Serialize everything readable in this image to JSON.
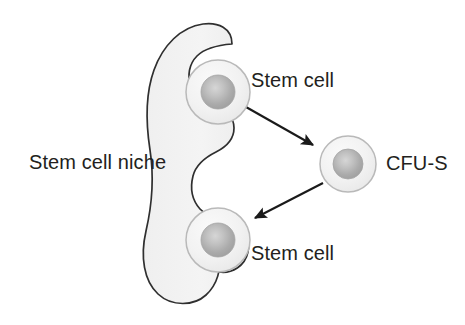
{
  "diagram": {
    "background_color": "#ffffff",
    "text_color": "#231f20",
    "labels": {
      "niche": "Stem cell niche",
      "stem_cell_top": "Stem cell",
      "stem_cell_bottom": "Stem cell",
      "cfu_s": "CFU-S"
    },
    "shapes": {
      "niche": {
        "name": "stem-cell-niche-body",
        "fill": "#f1f1f1",
        "stroke": "#2f2f2f",
        "stroke_width": 1.6
      },
      "cells": [
        {
          "name": "stem-cell-top",
          "cx": 218,
          "cy": 92,
          "r_outer": 32,
          "r_nucleus": 17,
          "outer_fill": "#f3f3f3",
          "outer_stroke": "#b9b9b9",
          "nucleus_fill": "#b0b0b0"
        },
        {
          "name": "cfu-s-cell",
          "cx": 348,
          "cy": 164,
          "r_outer": 28,
          "r_nucleus": 15,
          "outer_fill": "#f3f3f3",
          "outer_stroke": "#b9b9b9",
          "nucleus_fill": "#b0b0b0"
        },
        {
          "name": "stem-cell-bottom",
          "cx": 218,
          "cy": 240,
          "r_outer": 32,
          "r_nucleus": 17,
          "outer_fill": "#f3f3f3",
          "outer_stroke": "#b9b9b9",
          "nucleus_fill": "#b0b0b0"
        }
      ],
      "arrows": [
        {
          "name": "arrow-stem-cell-to-cfu-s",
          "from": [
            246,
            107
          ],
          "to": [
            317,
            147
          ],
          "color": "#1a1a1a"
        },
        {
          "name": "arrow-cfu-s-to-stem-cell",
          "from": [
            323,
            183
          ],
          "to": [
            251,
            220
          ],
          "color": "#1a1a1a"
        }
      ]
    }
  }
}
